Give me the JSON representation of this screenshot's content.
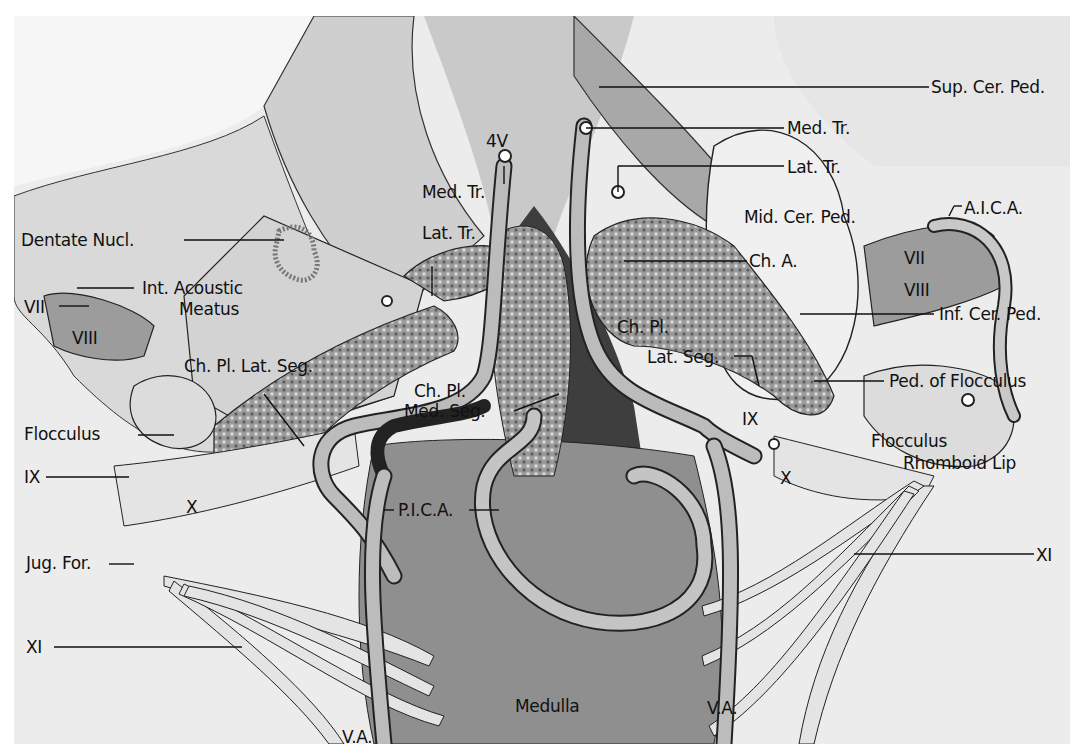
{
  "figure": {
    "type": "anatomical illustration",
    "colors": {
      "background": "#ffffff",
      "paper": "#eeeeee",
      "ink": "#111111",
      "shade_dark": "#3a3a3a",
      "shade_mid": "#8c8c8c",
      "shade_light": "#d6d6d6"
    }
  },
  "labels": {
    "sup_cer_ped": "Sup. Cer. Ped.",
    "med_tr_right": "Med. Tr.",
    "lat_tr_right": "Lat. Tr.",
    "four_v": "4V",
    "med_tr_left": "Med. Tr.",
    "mid_cer_ped": "Mid. Cer. Ped.",
    "aica": "A.I.C.A.",
    "lat_tr_left": "Lat. Tr.",
    "dentate_nucl": "Dentate Nucl.",
    "ch_a": "Ch. A.",
    "vii_right": "VII",
    "viii_right": "VIII",
    "int_acoustic": "Int. Acoustic",
    "meatus": "Meatus",
    "vii_left": "VII",
    "viii_left": "VIII",
    "ch_pl_right": "Ch. Pl.",
    "inf_cer_ped": "Inf. Cer. Ped.",
    "ch_pl_lat_seg": "Ch. Pl. Lat. Seg.",
    "lat_seg_right": "Lat. Seg.",
    "ped_of_flocculus": "Ped. of Flocculus",
    "ch_pl_med": "Ch. Pl.",
    "med_seg": "Med. Seg.",
    "flocculus_left": "Flocculus",
    "ix_right": "IX",
    "flocculus_right": "Flocculus",
    "rhomboid_lip": "Rhomboid Lip",
    "x_right": "X",
    "ix_left": "IX",
    "x_left": "X",
    "pica": "P.I.C.A.",
    "jug_for": "Jug. For.",
    "xi_right": "XI",
    "xi_left": "XI",
    "medulla": "Medulla",
    "va_left": "V.A.",
    "va_right": "V.A."
  }
}
